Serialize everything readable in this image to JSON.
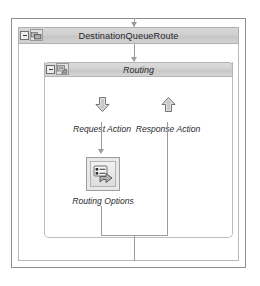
{
  "diagram": {
    "title": "DestinationQueueRoute",
    "outer_shape": {
      "name": "DestinationQueueRoute",
      "collapse_label": "-",
      "icon": "route-shape-icon"
    },
    "inner_shape": {
      "name": "Routing",
      "collapse_label": "-",
      "icon": "routing-shape-icon"
    },
    "nodes": [
      {
        "label": "Request Action",
        "icon": "arrow-down-icon"
      },
      {
        "label": "Response Action",
        "icon": "arrow-up-icon"
      },
      {
        "label": "Routing Options",
        "icon": "routing-options-icon"
      }
    ],
    "colors": {
      "header_gradient_top": "#d8d8d8",
      "header_gradient_bottom": "#c6c6c6",
      "frame_border": "#8d8d8d",
      "shape_border": "#b9b9b9",
      "connector": "#9c9c9c",
      "text": "#26262b",
      "canvas": "#ffffff"
    }
  }
}
